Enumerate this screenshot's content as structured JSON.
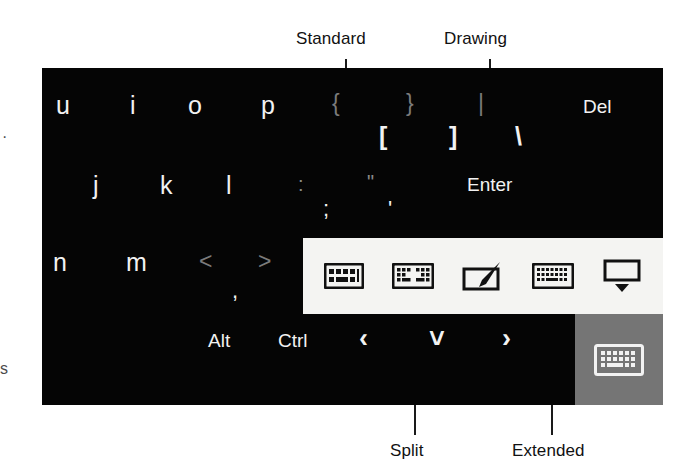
{
  "figure": {
    "type": "annotated-screenshot"
  },
  "callouts": {
    "top": [
      {
        "label": "Standard",
        "name": "callout-standard"
      },
      {
        "label": "Drawing",
        "name": "callout-drawing"
      }
    ],
    "bottom": [
      {
        "label": "Split",
        "name": "callout-split"
      },
      {
        "label": "Extended",
        "name": "callout-extended"
      }
    ]
  },
  "edge_artifacts": {
    "top_mark": "·",
    "bottom_mark": "s"
  },
  "keyboard": {
    "background_color": "#050505",
    "key_color": "#f2f2f2",
    "dim_key_color": "#7b7b7b",
    "rows": {
      "row1": {
        "letters": [
          "u",
          "i",
          "o",
          "p"
        ],
        "shift_symbols": [
          "{",
          "}",
          "|"
        ],
        "base_symbols": [
          "[",
          "]",
          "\\"
        ],
        "delete_label": "Del"
      },
      "row2": {
        "letters": [
          "j",
          "k",
          "l"
        ],
        "shift_symbols": [
          ":",
          "\""
        ],
        "base_symbols": [
          ";",
          "'"
        ],
        "enter_label": "Enter"
      },
      "row3": {
        "letters": [
          "n",
          "m"
        ],
        "shift_symbols": [
          "<",
          ">"
        ],
        "base_symbols": [
          ","
        ]
      },
      "row4": {
        "modifiers": [
          "Alt",
          "Ctrl"
        ],
        "arrows": [
          "‹",
          "˅",
          "›"
        ],
        "arrow_names": [
          "left-arrow-key",
          "down-arrow-key",
          "right-arrow-key"
        ]
      }
    }
  },
  "mode_popup": {
    "background_color": "#f4f4f2",
    "buttons": [
      {
        "name": "standard-keyboard-icon",
        "label": "Standard",
        "selected": false
      },
      {
        "name": "split-keyboard-icon",
        "label": "Split",
        "selected": false
      },
      {
        "name": "drawing-pad-icon",
        "label": "Drawing",
        "selected": false
      },
      {
        "name": "extended-keyboard-icon",
        "label": "Extended",
        "selected": false
      },
      {
        "name": "hide-keyboard-icon",
        "label": "Hide",
        "selected": false
      }
    ]
  },
  "hide_keyboard_button": {
    "name": "keyboard-toggle-button",
    "background_color": "#757575",
    "state": "active"
  }
}
